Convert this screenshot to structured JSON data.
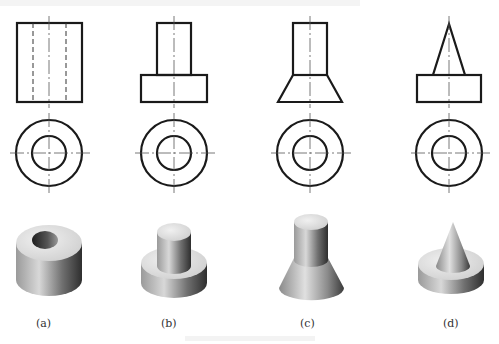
{
  "figure": {
    "top_text_faint": "",
    "caption_faint": "",
    "labels": [
      "(a)",
      "(b)",
      "(c)",
      "(d)"
    ],
    "panels": [
      {
        "id": "a",
        "description": "Hollow cylinder (tube): front view rectangle with hidden bore lines; top view two concentric circles; shaded 3D render"
      },
      {
        "id": "b",
        "description": "Stepped cylinder: small cylinder on larger disk; top view two concentric circles; shaded 3D render"
      },
      {
        "id": "c",
        "description": "Cylinder on truncated cone: top view two concentric circles; shaded 3D render"
      },
      {
        "id": "d",
        "description": "Cone on disk: top view two concentric circles; shaded 3D render"
      }
    ]
  },
  "colors": {
    "line": "#1a1a1a",
    "centerline": "#555555",
    "shade_light": "#e6e6e6",
    "shade_dark": "#333333"
  }
}
